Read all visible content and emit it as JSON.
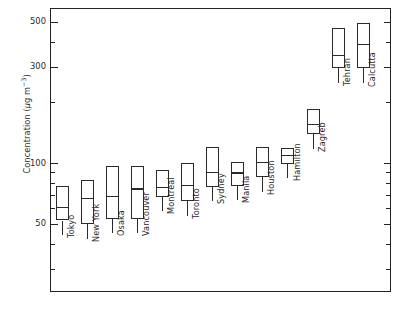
{
  "chart_data": {
    "type": "box",
    "title": "",
    "xlabel": "",
    "ylabel": "Concentration (µg m−3)",
    "ylabel_parts": {
      "text": "Concentration (",
      "unit_mu": "µg m",
      "exponent": "−3",
      "close": ")"
    },
    "yscale": "log",
    "ylim": [
      28,
      640
    ],
    "grid": false,
    "legend": "none",
    "ytick_labels": [
      "500",
      "300",
      "100",
      "50"
    ],
    "ytick_values": [
      500,
      300,
      100,
      50
    ],
    "yminor_values": [
      400,
      200,
      90,
      80,
      70,
      60,
      40,
      30
    ],
    "categories": [
      "Tokyo",
      "New York",
      "Osaka",
      "Vancouver",
      "Montreal",
      "Toronto",
      "Sydney",
      "Manila",
      "Houston",
      "Hamilton",
      "Zagreb",
      "Tehran",
      "Calcutta"
    ],
    "boxes": [
      {
        "label": "Tokyo",
        "top": 77,
        "median": 61,
        "bottom": 52
      },
      {
        "label": "New York",
        "top": 83,
        "median": 67,
        "bottom": 50
      },
      {
        "label": "Osaka",
        "top": 97,
        "median": 69,
        "bottom": 53
      },
      {
        "label": "Vancouver",
        "top": 97,
        "median": 75,
        "bottom": 53
      },
      {
        "label": "Montreal",
        "top": 93,
        "median": 76,
        "bottom": 68
      },
      {
        "label": "Toronto",
        "top": 100,
        "median": 78,
        "bottom": 65
      },
      {
        "label": "Sydney",
        "top": 120,
        "median": 91,
        "bottom": 76
      },
      {
        "label": "Manila",
        "top": 102,
        "median": 90,
        "bottom": 77
      },
      {
        "label": "Houston",
        "top": 120,
        "median": 101,
        "bottom": 85
      },
      {
        "label": "Hamilton",
        "top": 119,
        "median": 110,
        "bottom": 99
      },
      {
        "label": "Zagreb",
        "top": 185,
        "median": 157,
        "bottom": 140
      },
      {
        "label": "Tehran",
        "top": 465,
        "median": 345,
        "bottom": 297
      },
      {
        "label": "Calcutta",
        "top": 495,
        "median": 390,
        "bottom": 295
      }
    ],
    "stem_bottom_values": [
      44,
      42,
      45,
      45,
      58,
      55,
      65,
      66,
      72,
      84,
      118,
      250,
      248
    ]
  },
  "colors": {
    "line": "#2a2a2a",
    "frame": "#222222",
    "background": "#ffffff",
    "text": "#2a2a2a"
  }
}
